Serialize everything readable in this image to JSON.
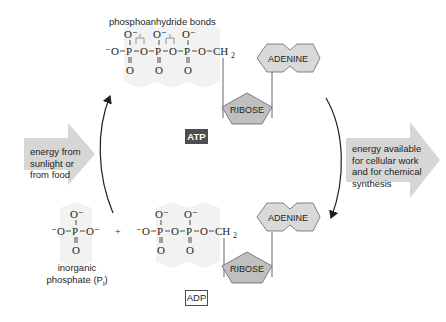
{
  "diagram": {
    "colors": {
      "arrow_fill": "#d6d6d6",
      "molecule_fill": "#d9d9d9",
      "ribose_fill": "#bfbfbf",
      "halo": "#f0f0f0",
      "ink": "#231f20",
      "atp_badge_bg": "#4d4d4f"
    },
    "atp": {
      "bond_label": "phosphoanhydride bonds",
      "badge": "ATP",
      "chain": {
        "o_minus_left": "⁻O",
        "phosphorus": [
          "P",
          "P",
          "P"
        ],
        "bridging_o": [
          "O",
          "O",
          "O"
        ],
        "top_o": [
          "O⁻",
          "O⁻",
          "O⁻"
        ],
        "bottom_o": [
          "O",
          "O",
          "O"
        ],
        "ch2": "CH",
        "ch2_sub": "2"
      },
      "adenine": "ADENINE",
      "ribose": "RIBOSE"
    },
    "adp": {
      "badge": "ADP",
      "chain": {
        "o_minus_left": "⁻O",
        "phosphorus": [
          "P",
          "P"
        ],
        "bridging_o": [
          "O",
          "O"
        ],
        "top_o": [
          "O⁻",
          "O⁻"
        ],
        "bottom_o": [
          "O",
          "O"
        ],
        "ch2": "CH",
        "ch2_sub": "2"
      },
      "adenine": "ADENINE",
      "ribose": "RIBOSE"
    },
    "phosphate": {
      "left": "⁻O",
      "p": "P",
      "right": "O⁻",
      "top": "O⁻",
      "bottom": "O",
      "caption_line1": "inorganic",
      "caption_line2": "phosphate (P",
      "caption_sub": "i",
      "caption_end": ")"
    },
    "plus": "+",
    "input_arrow": {
      "lines": [
        "energy from",
        "sunlight or",
        "from food"
      ]
    },
    "output_arrow": {
      "lines": [
        "energy available",
        "for cellular work",
        "and for chemical",
        "synthesis"
      ]
    }
  }
}
